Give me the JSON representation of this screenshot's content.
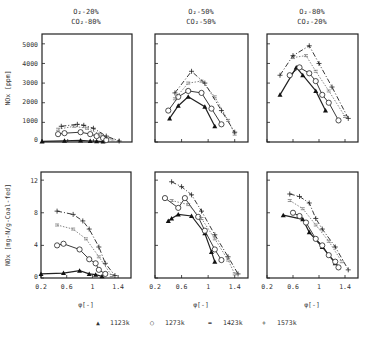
{
  "chart_data": [
    {
      "type": "scatter",
      "panel": "top-left",
      "title": "O2-20% CO2-80%",
      "title_lines": [
        "O₂-20%",
        "CO₂-80%"
      ],
      "ylabel": "NOx [ppm]",
      "xlabel": "",
      "xlim": [
        0.2,
        1.6
      ],
      "ylim": [
        0,
        5500
      ],
      "yticks": [
        0,
        1000,
        2000,
        3000,
        4000,
        5000
      ],
      "series": [
        {
          "name": "1123k",
          "x": [
            0.2,
            0.55,
            0.8,
            0.95,
            1.05,
            1.15
          ],
          "y": [
            30,
            60,
            80,
            50,
            40,
            20
          ]
        },
        {
          "name": "1273k",
          "x": [
            0.45,
            0.55,
            0.8,
            0.95,
            1.05,
            1.15,
            1.2
          ],
          "y": [
            400,
            450,
            500,
            400,
            300,
            200,
            100
          ]
        },
        {
          "name": "1423k",
          "x": [
            0.45,
            0.7,
            0.9,
            1.1,
            1.3
          ],
          "y": [
            650,
            800,
            700,
            400,
            100
          ]
        },
        {
          "name": "1573k",
          "x": [
            0.5,
            0.75,
            0.85,
            1.0,
            1.2,
            1.4
          ],
          "y": [
            800,
            900,
            850,
            700,
            300,
            50
          ]
        }
      ]
    },
    {
      "type": "scatter",
      "panel": "top-middle",
      "title": "O2-50% CO2-50%",
      "title_lines": [
        "O₂-50%",
        "CO₂-50%"
      ],
      "xlim": [
        0.2,
        1.6
      ],
      "ylim": [
        0,
        5500
      ],
      "series": [
        {
          "name": "1123k",
          "x": [
            0.42,
            0.55,
            0.7,
            0.95,
            1.1
          ],
          "y": [
            1200,
            1850,
            2300,
            1800,
            800
          ]
        },
        {
          "name": "1273k",
          "x": [
            0.4,
            0.55,
            0.7,
            0.9,
            1.05,
            1.2
          ],
          "y": [
            1600,
            2300,
            2600,
            2500,
            1700,
            900
          ]
        },
        {
          "name": "1423k",
          "x": [
            0.5,
            0.7,
            0.9,
            1.1,
            1.3,
            1.4
          ],
          "y": [
            2200,
            3000,
            3100,
            2300,
            1100,
            400
          ]
        },
        {
          "name": "1573k",
          "x": [
            0.5,
            0.75,
            0.95,
            1.2,
            1.4
          ],
          "y": [
            2500,
            3600,
            3000,
            1600,
            500
          ]
        }
      ]
    },
    {
      "type": "scatter",
      "panel": "top-right",
      "title": "O2-80% CO2-20%",
      "title_lines": [
        "O₂-80%",
        "CO₂-20%"
      ],
      "xlim": [
        0.2,
        1.6
      ],
      "ylim": [
        0,
        5500
      ],
      "series": [
        {
          "name": "1123k",
          "x": [
            0.4,
            0.65,
            0.75,
            0.95,
            1.1
          ],
          "y": [
            2400,
            3800,
            3400,
            2600,
            1600
          ]
        },
        {
          "name": "1273k",
          "x": [
            0.55,
            0.7,
            0.85,
            0.95,
            1.05,
            1.15,
            1.3
          ],
          "y": [
            3400,
            3800,
            3500,
            3100,
            2400,
            2000,
            1100
          ]
        },
        {
          "name": "1423k",
          "x": [
            0.6,
            0.8,
            0.95,
            1.15,
            1.4
          ],
          "y": [
            4300,
            4400,
            3600,
            2600,
            1300
          ]
        },
        {
          "name": "1573k",
          "x": [
            0.4,
            0.6,
            0.85,
            1.0,
            1.2,
            1.45
          ],
          "y": [
            3400,
            4400,
            4900,
            4000,
            2800,
            1200
          ]
        }
      ]
    },
    {
      "type": "scatter",
      "panel": "bottom-left",
      "ylabel": "NOx [mg-N/g-Coal-fed]",
      "xlabel": "φ[-]",
      "xlim": [
        0.2,
        1.6
      ],
      "ylim": [
        0,
        13
      ],
      "xticks": [
        0.2,
        0.6,
        1,
        1.4
      ],
      "yticks": [
        0,
        4,
        8,
        12
      ],
      "series": [
        {
          "name": "1123k",
          "x": [
            0.2,
            0.55,
            0.8,
            0.95,
            1.05,
            1.15
          ],
          "y": [
            0.5,
            0.6,
            0.9,
            0.5,
            0.4,
            0.2
          ]
        },
        {
          "name": "1273k",
          "x": [
            0.45,
            0.55,
            0.8,
            0.95,
            1.05,
            1.1,
            1.2
          ],
          "y": [
            4.0,
            4.2,
            3.5,
            2.3,
            1.8,
            1.0,
            0.5
          ]
        },
        {
          "name": "1423k",
          "x": [
            0.45,
            0.7,
            0.9,
            1.1,
            1.3
          ],
          "y": [
            6.5,
            6.0,
            4.8,
            2.6,
            0.3
          ]
        },
        {
          "name": "1573k",
          "x": [
            0.45,
            0.7,
            0.85,
            0.95,
            1.1,
            1.2,
            1.35
          ],
          "y": [
            8.2,
            7.8,
            7.0,
            6.0,
            3.8,
            1.8,
            0.3
          ]
        }
      ]
    },
    {
      "type": "scatter",
      "panel": "bottom-middle",
      "xlabel": "φ[-]",
      "xlim": [
        0.2,
        1.6
      ],
      "ylim": [
        0,
        13
      ],
      "xticks": [
        0.2,
        0.6,
        1,
        1.4
      ],
      "series": [
        {
          "name": "1123k",
          "x": [
            0.4,
            0.45,
            0.55,
            0.75,
            0.95,
            1.05,
            1.1
          ],
          "y": [
            7.0,
            7.3,
            7.8,
            7.6,
            5.5,
            3.2,
            2.0
          ]
        },
        {
          "name": "1273k",
          "x": [
            0.35,
            0.55,
            0.65,
            0.85,
            0.95,
            1.1,
            1.2
          ],
          "y": [
            9.8,
            8.6,
            9.8,
            7.5,
            5.8,
            3.5,
            2.2
          ]
        },
        {
          "name": "1423k",
          "x": [
            0.45,
            0.7,
            0.9,
            1.1,
            1.3,
            1.4
          ],
          "y": [
            9.5,
            9.0,
            7.3,
            4.8,
            2.2,
            0.5
          ]
        },
        {
          "name": "1573k",
          "x": [
            0.45,
            0.6,
            0.75,
            0.9,
            1.1,
            1.3,
            1.45
          ],
          "y": [
            11.8,
            11.2,
            10.2,
            8.2,
            5.3,
            2.6,
            0.5
          ]
        }
      ]
    },
    {
      "type": "scatter",
      "panel": "bottom-right",
      "xlabel": "φ[-]",
      "xlim": [
        0.2,
        1.6
      ],
      "ylim": [
        0,
        13
      ],
      "xticks": [
        0.2,
        0.6,
        1,
        1.4
      ],
      "series": [
        {
          "name": "1123k",
          "x": [
            0.45,
            0.75,
            0.85,
            1.05,
            1.25
          ],
          "y": [
            7.7,
            7.2,
            5.6,
            3.8,
            1.8
          ]
        },
        {
          "name": "1273k",
          "x": [
            0.6,
            0.7,
            0.8,
            0.95,
            1.05,
            1.15,
            1.25,
            1.3
          ],
          "y": [
            8.0,
            7.6,
            6.8,
            4.8,
            4.0,
            2.8,
            2.0,
            1.3
          ]
        },
        {
          "name": "1423k",
          "x": [
            0.55,
            0.75,
            0.95,
            1.15,
            1.35
          ],
          "y": [
            9.5,
            8.5,
            6.5,
            4.5,
            2.0
          ]
        },
        {
          "name": "1573k",
          "x": [
            0.55,
            0.7,
            0.85,
            0.95,
            1.05,
            1.25,
            1.45
          ],
          "y": [
            10.3,
            10.0,
            9.2,
            7.3,
            6.0,
            3.8,
            1.0
          ]
        }
      ]
    }
  ],
  "legend": {
    "items": [
      {
        "marker": "▲",
        "label": "1123k"
      },
      {
        "marker": "○",
        "label": "1273k"
      },
      {
        "marker": "=",
        "label": "1423k"
      },
      {
        "marker": "+",
        "label": "1573k"
      }
    ]
  },
  "labels": {
    "top_ylabel": "NOx [ppm]",
    "bottom_ylabel": "NOx [mg-N/g-Coal-fed]",
    "xlabel": "φ[-]",
    "top_yticks": [
      "5000",
      "4000",
      "3000",
      "2000",
      "1000",
      "0"
    ],
    "bottom_yticks": [
      "12",
      "8",
      "4",
      "0"
    ],
    "xticks": [
      "0.2",
      "0.6",
      "1",
      "1.4"
    ],
    "titles": [
      {
        "l1": "O₂-20%",
        "l2": "CO₂-80%"
      },
      {
        "l1": "O₂-50%",
        "l2": "CO₂-50%"
      },
      {
        "l1": "O₂-80%",
        "l2": "CO₂-20%"
      }
    ]
  }
}
